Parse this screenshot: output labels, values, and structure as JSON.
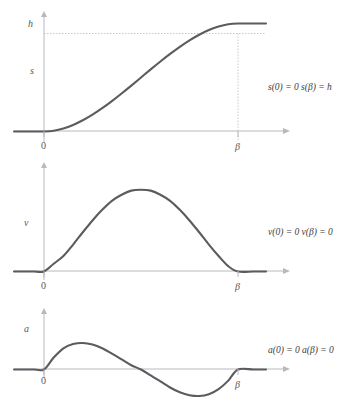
{
  "figure": {
    "title": "",
    "background_color": "#ffffff",
    "curve_color": "#5b5b60",
    "axis_color": "#b9b9bd",
    "text_color": "#3d3d42"
  },
  "panels": [
    {
      "id": "position",
      "y_axis_label": "s",
      "y_tick_label": "h",
      "x_tick_zero": "0",
      "x_tick_beta": "β",
      "equation_left": "s(0) = 0",
      "equation_right": "s(β) = h",
      "equation_full": "s(0) = 0   s(β) = h",
      "has_h_dashed_line": true,
      "has_beta_vertical_line": true
    },
    {
      "id": "velocity",
      "y_axis_label": "v",
      "y_tick_label": "",
      "x_tick_zero": "0",
      "x_tick_beta": "β",
      "equation_left": "v(0) = 0",
      "equation_right": "v(β) = 0",
      "equation_full": "v(0) = 0   v(β) = 0",
      "has_h_dashed_line": false,
      "has_beta_vertical_line": false
    },
    {
      "id": "acceleration",
      "y_axis_label": "a",
      "y_tick_label": "",
      "x_tick_zero": "0",
      "x_tick_beta": "β",
      "equation_left": "a(0) = 0",
      "equation_right": "a(β) = 0",
      "equation_full": "a(0) = 0   a(β) = 0",
      "has_h_dashed_line": false,
      "has_beta_vertical_line": false
    }
  ],
  "chart_data": {
    "type": "line",
    "title": "",
    "xlabel": "",
    "ylabel": "",
    "grid": false,
    "legend": "none",
    "subplots": [
      {
        "name": "position",
        "ylabel": "s",
        "xlabel": "",
        "x_ticks": [
          0,
          1
        ],
        "x_tick_labels": [
          "0",
          "β"
        ],
        "y_ticks": [
          0,
          1
        ],
        "y_tick_labels": [
          "",
          "h"
        ],
        "xlim": [
          -0.12,
          1.16
        ],
        "ylim": [
          -0.08,
          1.22
        ],
        "annotations": [
          "s(0) = 0",
          "s(β) = h"
        ],
        "description": "Smooth S-shaped (smoothstep) curve rising from 0 at x=0 to h at x=β, flat before 0 and after β",
        "x": [
          -0.12,
          -0.05,
          0.0,
          0.05,
          0.1,
          0.15,
          0.2,
          0.25,
          0.3,
          0.35,
          0.4,
          0.45,
          0.5,
          0.55,
          0.6,
          0.65,
          0.7,
          0.75,
          0.8,
          0.85,
          0.9,
          0.95,
          1.0,
          1.08,
          1.16
        ],
        "y": [
          0.0,
          0.0,
          0.0,
          0.007,
          0.028,
          0.061,
          0.104,
          0.156,
          0.216,
          0.282,
          0.352,
          0.425,
          0.5,
          0.575,
          0.648,
          0.718,
          0.784,
          0.844,
          0.896,
          0.939,
          0.972,
          0.993,
          1.0,
          1.0,
          1.0
        ]
      },
      {
        "name": "velocity",
        "ylabel": "v",
        "xlabel": "",
        "x_ticks": [
          0,
          1
        ],
        "x_tick_labels": [
          "0",
          "β"
        ],
        "y_ticks": [],
        "y_tick_labels": [],
        "xlim": [
          -0.12,
          1.16
        ],
        "ylim": [
          -0.08,
          1.22
        ],
        "annotations": [
          "v(0) = 0",
          "v(β) = 0"
        ],
        "description": "Bell-shaped velocity profile, zero at x=0 and x=β, peak at x=β/2",
        "x": [
          -0.12,
          -0.05,
          0.0,
          0.05,
          0.1,
          0.15,
          0.2,
          0.25,
          0.3,
          0.35,
          0.4,
          0.45,
          0.5,
          0.55,
          0.6,
          0.65,
          0.7,
          0.75,
          0.8,
          0.85,
          0.9,
          0.95,
          1.0,
          1.08,
          1.16
        ],
        "y": [
          0.0,
          0.0,
          0.0,
          0.095,
          0.19,
          0.33,
          0.48,
          0.625,
          0.755,
          0.865,
          0.94,
          0.99,
          1.0,
          0.99,
          0.94,
          0.865,
          0.755,
          0.625,
          0.48,
          0.33,
          0.19,
          0.065,
          0.0,
          0.0,
          0.0
        ]
      },
      {
        "name": "acceleration",
        "ylabel": "a",
        "xlabel": "",
        "x_ticks": [
          0,
          1
        ],
        "x_tick_labels": [
          "0",
          "β"
        ],
        "y_ticks": [],
        "y_tick_labels": [],
        "xlim": [
          -0.12,
          1.16
        ],
        "ylim": [
          -1.15,
          1.15
        ],
        "annotations": [
          "a(0) = 0",
          "a(β) = 0"
        ],
        "description": "Sinusoidal acceleration: zero at x=0, positive peak near x=0.2, zero crossing at x=0.5, negative trough near x=0.8, back to zero at x=β",
        "x": [
          -0.12,
          -0.05,
          0.0,
          0.05,
          0.1,
          0.15,
          0.2,
          0.25,
          0.3,
          0.35,
          0.4,
          0.45,
          0.5,
          0.55,
          0.6,
          0.65,
          0.7,
          0.75,
          0.8,
          0.85,
          0.9,
          0.95,
          1.0,
          1.08,
          1.16
        ],
        "y": [
          0.0,
          0.0,
          0.0,
          0.45,
          0.8,
          0.96,
          1.0,
          0.94,
          0.8,
          0.6,
          0.38,
          0.16,
          0.0,
          -0.22,
          -0.45,
          -0.68,
          -0.86,
          -0.97,
          -1.0,
          -0.93,
          -0.74,
          -0.42,
          0.0,
          0.0,
          0.0
        ]
      }
    ]
  }
}
